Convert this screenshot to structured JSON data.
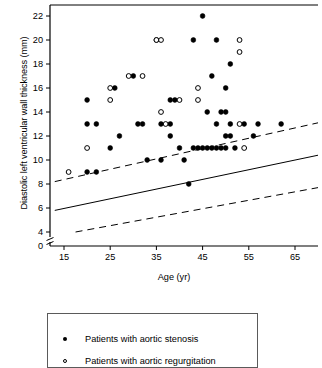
{
  "chart_data": {
    "type": "scatter",
    "title": "",
    "xlabel": "Age (yr)",
    "ylabel": "Diastolic left ventricular wall thickness (mm)",
    "xlim": [
      12,
      70
    ],
    "ylim": [
      4,
      23
    ],
    "xticks": [
      15,
      25,
      35,
      45,
      55,
      65
    ],
    "yticks": [
      0,
      4,
      6,
      8,
      10,
      12,
      14,
      16,
      18,
      20,
      22
    ],
    "axis_break": true,
    "grid": false,
    "legend_position": "below-plot",
    "series": [
      {
        "name": "Patients with aortic stenosis",
        "marker": "filled-circle",
        "color": "#000000",
        "points": [
          [
            20,
            9
          ],
          [
            20,
            13
          ],
          [
            20,
            15
          ],
          [
            22,
            9
          ],
          [
            22,
            13
          ],
          [
            25,
            11
          ],
          [
            26,
            16
          ],
          [
            27,
            12
          ],
          [
            30,
            17
          ],
          [
            31,
            13
          ],
          [
            32,
            13
          ],
          [
            33,
            10
          ],
          [
            35,
            20
          ],
          [
            36,
            13
          ],
          [
            36,
            10
          ],
          [
            38,
            15
          ],
          [
            38,
            13
          ],
          [
            38,
            12
          ],
          [
            39,
            15
          ],
          [
            40,
            11
          ],
          [
            41,
            10
          ],
          [
            42,
            8
          ],
          [
            43,
            20
          ],
          [
            43,
            11
          ],
          [
            44,
            11
          ],
          [
            45,
            22
          ],
          [
            45,
            11
          ],
          [
            46,
            14
          ],
          [
            46,
            11
          ],
          [
            47,
            17
          ],
          [
            47,
            11
          ],
          [
            48,
            20
          ],
          [
            48,
            13
          ],
          [
            48,
            11
          ],
          [
            49,
            14
          ],
          [
            49,
            11
          ],
          [
            50,
            14
          ],
          [
            50,
            12
          ],
          [
            50,
            16
          ],
          [
            50,
            11
          ],
          [
            51,
            12
          ],
          [
            51,
            18
          ],
          [
            51,
            13
          ],
          [
            52,
            11
          ],
          [
            54,
            13
          ],
          [
            56,
            12
          ],
          [
            57,
            13
          ],
          [
            62,
            13
          ]
        ]
      },
      {
        "name": "Patients with aortic regurgitation",
        "marker": "open-circle",
        "color": "#000000",
        "points": [
          [
            16,
            9
          ],
          [
            20,
            11
          ],
          [
            25,
            15
          ],
          [
            25,
            16
          ],
          [
            29,
            17
          ],
          [
            32,
            17
          ],
          [
            35,
            20
          ],
          [
            36,
            20
          ],
          [
            36,
            14
          ],
          [
            37,
            13
          ],
          [
            40,
            15
          ],
          [
            44,
            16
          ],
          [
            44,
            15
          ],
          [
            53,
            20
          ],
          [
            53,
            19
          ],
          [
            53,
            13
          ],
          [
            54,
            11
          ]
        ]
      }
    ],
    "lines": [
      {
        "name": "regression-line",
        "style": "solid",
        "points": [
          [
            13,
            5.8
          ],
          [
            70,
            10.4
          ]
        ]
      },
      {
        "name": "upper-prediction-limit",
        "style": "dashed",
        "points": [
          [
            13,
            8.2
          ],
          [
            70,
            13.1
          ]
        ]
      },
      {
        "name": "lower-prediction-limit",
        "style": "dashed",
        "points": [
          [
            17.5,
            4.0
          ],
          [
            70,
            7.7
          ]
        ]
      }
    ]
  },
  "legend": {
    "items": [
      {
        "marker": "filled-circle",
        "label": "Patients with aortic stenosis"
      },
      {
        "marker": "open-circle",
        "label": "Patients with aortic regurgitation"
      }
    ]
  },
  "axis": {
    "x_label": "Age (yr)",
    "y_label": "Diastolic left ventricular wall thickness (mm)",
    "x_tick_labels": [
      "15",
      "25",
      "35",
      "45",
      "55",
      "65"
    ],
    "y_tick_labels": [
      "0",
      "4",
      "6",
      "8",
      "10",
      "12",
      "14",
      "16",
      "18",
      "20",
      "22"
    ]
  }
}
